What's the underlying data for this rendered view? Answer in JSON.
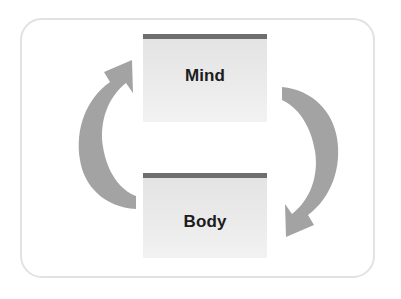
{
  "diagram": {
    "frame": {
      "border_color": "#e2e2e2"
    },
    "nodes": [
      {
        "id": "mind",
        "label": "Mind",
        "accent_color": "#6e6e6e",
        "fill_color": "#e9e9e9",
        "text_color": "#1c1c1c"
      },
      {
        "id": "body",
        "label": "Body",
        "accent_color": "#6e6e6e",
        "fill_color": "#e9e9e9",
        "text_color": "#1c1c1c"
      }
    ],
    "arrows": [
      {
        "id": "left-arrow",
        "name": "body-to-mind-arrow",
        "direction": "up-right",
        "from": "Body",
        "to": "Mind",
        "color": "#a3a3a3"
      },
      {
        "id": "right-arrow",
        "name": "mind-to-body-arrow",
        "direction": "down-left",
        "from": "Mind",
        "to": "Body",
        "color": "#a3a3a3"
      }
    ]
  }
}
